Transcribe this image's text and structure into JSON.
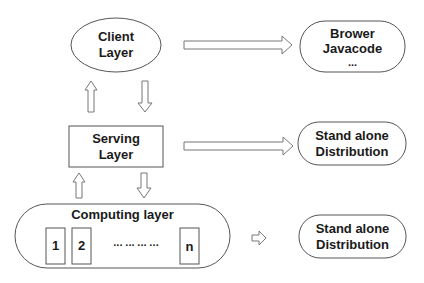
{
  "diagram": {
    "client_layer": {
      "line1": "Client",
      "line2": "Layer"
    },
    "serving_layer": {
      "line1": "Serving",
      "line2": "Layer"
    },
    "computing_layer": {
      "title": "Computing layer",
      "nodes": [
        "1",
        "2",
        "n"
      ],
      "ellipsis": "··· ··· ··· ···"
    },
    "targets": [
      {
        "line1": "Brower",
        "line2": "Javacode",
        "line3": "..."
      },
      {
        "line1": "Stand alone",
        "line2": "Distribution"
      },
      {
        "line1": "Stand alone",
        "line2": "Distribution"
      }
    ]
  },
  "colors": {
    "stroke": "#555555",
    "arrow_stroke": "#777777",
    "text": "#1a1a1a",
    "background": "#ffffff"
  }
}
